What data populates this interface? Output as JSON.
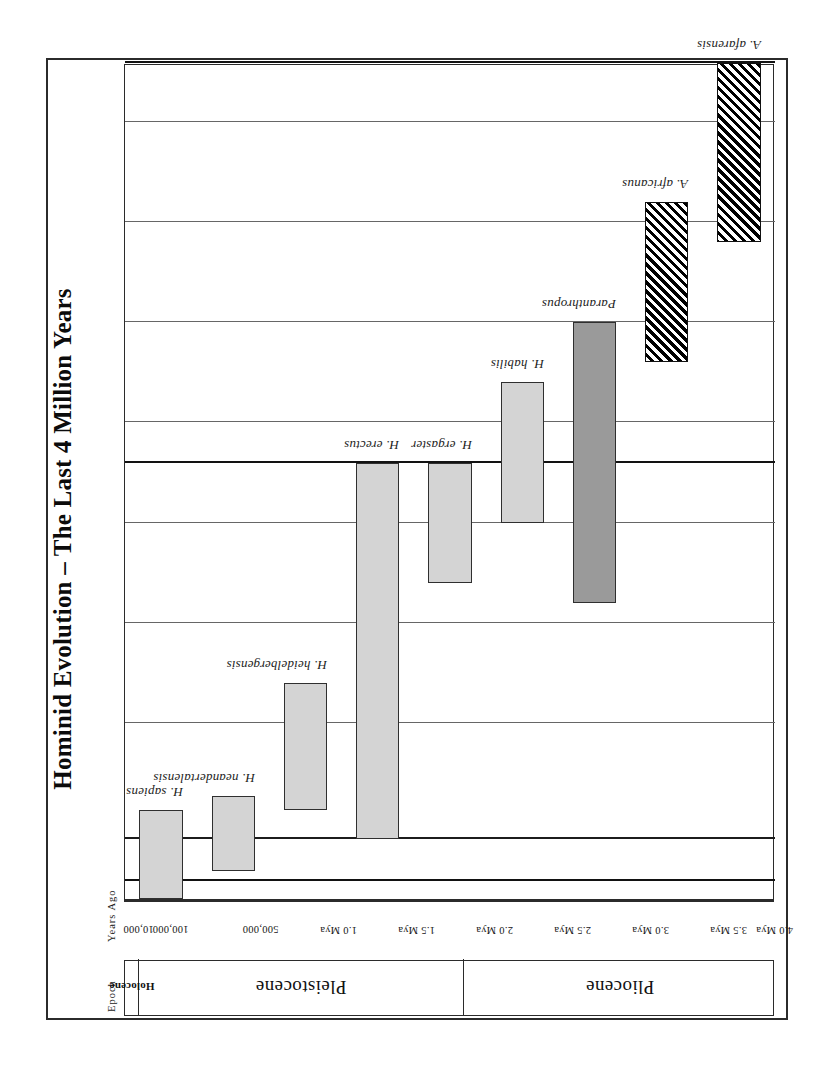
{
  "figure": {
    "title": "Hominid Evolution – The Last 4 Million Years",
    "headers": {
      "epoch": "Epoch",
      "years": "Years Ago"
    }
  },
  "chart_data": {
    "type": "bar",
    "orientation": "horizontal-timeline-rotated-90",
    "title": "Hominid Evolution – The Last 4 Million Years",
    "xlabel": "Years Ago",
    "ylabel": "",
    "axis_unit": "Mya",
    "xlim": [
      0.0,
      4.2
    ],
    "grid": true,
    "legend": "none",
    "tick_labels": [
      "10,000",
      "100,000",
      "500,000",
      "1.0 Mya",
      "1.5 Mya",
      "2.0 Mya",
      "2.5 Mya",
      "3.0 Mya",
      "3.5 Mya",
      "4.0 Mya"
    ],
    "tick_values_mya": [
      0.01,
      0.1,
      0.5,
      1.0,
      1.5,
      2.0,
      2.5,
      3.0,
      3.5,
      4.0
    ],
    "epochs": [
      {
        "name": "Holocene",
        "start_mya": 0.0,
        "end_mya": 0.01,
        "emphasis": "bold"
      },
      {
        "name": "Pleistocene",
        "start_mya": 0.01,
        "end_mya": 1.8,
        "emphasis": "normal"
      },
      {
        "name": "Pliocene",
        "start_mya": 1.8,
        "end_mya": 4.2,
        "emphasis": "normal"
      }
    ],
    "categories": [
      "H. sapiens",
      "H. neandertalensis",
      "H. heidelbergensis",
      "H. erectus",
      "H. ergaster",
      "H. habilis",
      "Paranthropus",
      "A. africanus",
      "A. afarensis"
    ],
    "series": [
      {
        "name": "Hominid species range",
        "bars": [
          {
            "label": "H. sapiens",
            "start_mya": 0.0,
            "end_mya": 0.2,
            "fill": "light"
          },
          {
            "label": "H. neandertalensis",
            "start_mya": 0.03,
            "end_mya": 0.25,
            "fill": "light"
          },
          {
            "label": "H. heidelbergensis",
            "start_mya": 0.2,
            "end_mya": 0.7,
            "fill": "light"
          },
          {
            "label": "H. erectus",
            "start_mya": 0.1,
            "end_mya": 1.8,
            "fill": "light"
          },
          {
            "label": "H. ergaster",
            "start_mya": 1.2,
            "end_mya": 1.8,
            "fill": "light"
          },
          {
            "label": "H. habilis",
            "start_mya": 1.5,
            "end_mya": 2.2,
            "fill": "light"
          },
          {
            "label": "Paranthropus",
            "start_mya": 1.1,
            "end_mya": 2.5,
            "fill": "dark"
          },
          {
            "label": "A. africanus",
            "start_mya": 2.3,
            "end_mya": 3.1,
            "fill": "hatch"
          },
          {
            "label": "A. afarensis",
            "start_mya": 2.9,
            "end_mya": 4.0,
            "fill": "hatch"
          }
        ]
      }
    ],
    "colors": {
      "light_fill": "#d4d4d4",
      "dark_fill": "#9a9a9a",
      "hatch_fill": "#000000",
      "line": "#2b2b2b",
      "background": "#ffffff"
    }
  }
}
